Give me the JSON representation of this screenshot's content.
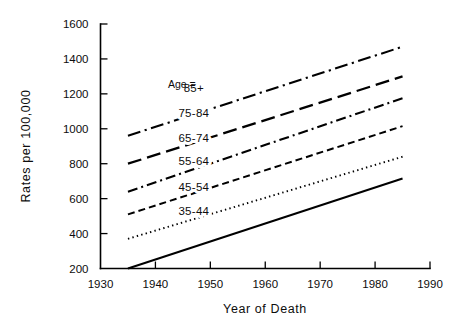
{
  "chart_data": {
    "type": "line",
    "title": "",
    "xlabel": "Year of Death",
    "ylabel": "Rates per 100,000",
    "xlim": [
      1930,
      1990
    ],
    "ylim": [
      200,
      1600
    ],
    "grid": false,
    "legend_position": "inline-right-of-line",
    "legend_header": "Age =",
    "xticks": [
      1930,
      1940,
      1950,
      1960,
      1970,
      1980,
      1990
    ],
    "xtick_labels": [
      "1930",
      "1940",
      "1950",
      "1960",
      "1970",
      "1980",
      "1990"
    ],
    "yticks": [
      200,
      400,
      600,
      800,
      1000,
      1200,
      1400,
      1600
    ],
    "ytick_labels": [
      "200",
      "400",
      "600",
      "800",
      "1000",
      "1200",
      "1400",
      "1600"
    ],
    "x": [
      1935,
      1985
    ],
    "series": [
      {
        "name": "85+",
        "values": [
          960,
          1470
        ],
        "style": "dash-dot-long",
        "label_x": 1947,
        "label_y": 1210
      },
      {
        "name": "75-84",
        "values": [
          800,
          1300
        ],
        "style": "long-dash",
        "label_x": 1947,
        "label_y": 1070
      },
      {
        "name": "65-74",
        "values": [
          640,
          1175
        ],
        "style": "dash-dot",
        "label_x": 1947,
        "label_y": 925
      },
      {
        "name": "55-64",
        "values": [
          510,
          1015
        ],
        "style": "medium-dash",
        "label_x": 1947,
        "label_y": 790
      },
      {
        "name": "45-54",
        "values": [
          370,
          840
        ],
        "style": "dotted",
        "label_x": 1947,
        "label_y": 645
      },
      {
        "name": "35-44",
        "values": [
          200,
          715
        ],
        "style": "solid",
        "label_x": 1947,
        "label_y": 505
      }
    ]
  }
}
